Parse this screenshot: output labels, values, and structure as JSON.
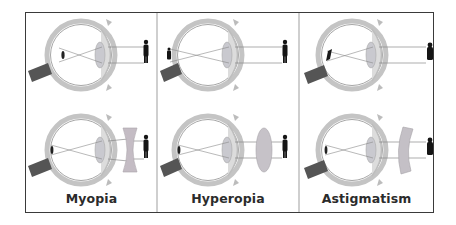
{
  "figure": {
    "panels": [
      {
        "id": "myopia",
        "label": "Myopia",
        "top_diagram": {
          "focus": "in front of retina",
          "lens": "none"
        },
        "bottom_diagram": {
          "focus": "on retina",
          "lens": "concave"
        }
      },
      {
        "id": "hyperopia",
        "label": "Hyperopia",
        "top_diagram": {
          "focus": "behind retina",
          "lens": "none"
        },
        "bottom_diagram": {
          "focus": "on retina",
          "lens": "convex"
        }
      },
      {
        "id": "astigmatism",
        "label": "Astigmatism",
        "top_diagram": {
          "focus": "distorted on retina",
          "lens": "none"
        },
        "bottom_diagram": {
          "focus": "on retina",
          "lens": "cylindrical"
        }
      }
    ]
  },
  "colors": {
    "frame_border": "#3a3a3a",
    "divider": "#cfcfcf",
    "sclera": "#bdbdbd",
    "sclera_inner": "#e6e6e6",
    "lens": "#c9c9cf",
    "optic_nerve": "#555555",
    "ray": "#8a8a8a",
    "figure": "#151515",
    "corrective_lens": "#c4c0c6",
    "label_text": "#2b2b2b"
  }
}
